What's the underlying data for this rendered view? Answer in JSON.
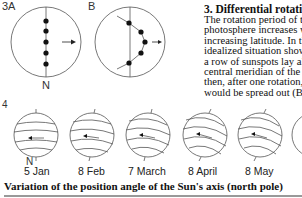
{
  "figure3": {
    "label_a": "3A",
    "label_b": "B",
    "label_n": "N"
  },
  "figure4": {
    "label": "4",
    "label_n": "N",
    "dates": [
      "5 Jan",
      "8 Feb",
      "7 March",
      "8 April",
      "8 May"
    ]
  },
  "section": {
    "title": "3. Differential rotation",
    "lines": [
      "The rotation period of the",
      "photosphere increases with",
      "increasing latitude. In the",
      "idealized situation shown l",
      "a row of sunspots lay alon",
      "central meridian of the Sur",
      "then, after one rotation, th",
      "would be spread out (B)."
    ]
  },
  "caption": "Variation of the position angle of the Sun's axis (north pole)"
}
